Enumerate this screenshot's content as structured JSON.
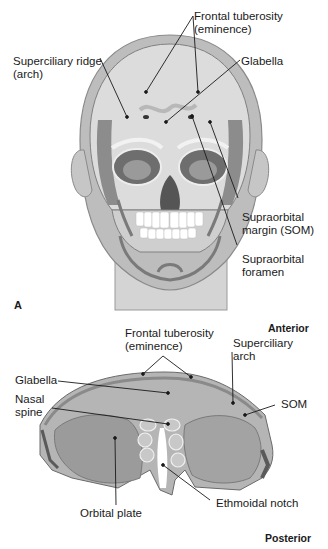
{
  "figure": {
    "panel_a": {
      "panel_label": "A",
      "title": "Frontal view of skull within head",
      "labels": {
        "frontal_tuberosity_line1": "Frontal  tuberosity",
        "frontal_tuberosity_line2": "(eminence)",
        "superciliary_ridge_line1": "Superciliary ridge",
        "superciliary_ridge_line2": "(arch)",
        "glabella": "Glabella",
        "supraorbital_margin_line1": "Supraorbital",
        "supraorbital_margin_line2": "margin (SOM)",
        "supraorbital_foramen_line1": "Supraorbital",
        "supraorbital_foramen_line2": "foramen"
      }
    },
    "panel_b": {
      "title": "Frontal bone, inferior view",
      "orientation": {
        "top": "Anterior",
        "bottom": "Posterior"
      },
      "labels": {
        "frontal_tuberosity_line1": "Frontal tuberosity",
        "frontal_tuberosity_line2": "(eminence)",
        "superciliary_arch_line1": "Superciliary",
        "superciliary_arch_line2": "arch",
        "glabella": "Glabella",
        "nasal_spine_line1": "Nasal",
        "nasal_spine_line2": "spine",
        "som": "SOM",
        "orbital_plate": "Orbital plate",
        "ethmoidal_notch": "Ethmoidal notch"
      }
    },
    "colors": {
      "bone_light": "#d9d9d9",
      "bone_mid": "#a8a8a8",
      "bone_dark": "#7a7a7a",
      "skin": "#c8c8c8",
      "leader_line": "#1a1a1a"
    }
  }
}
